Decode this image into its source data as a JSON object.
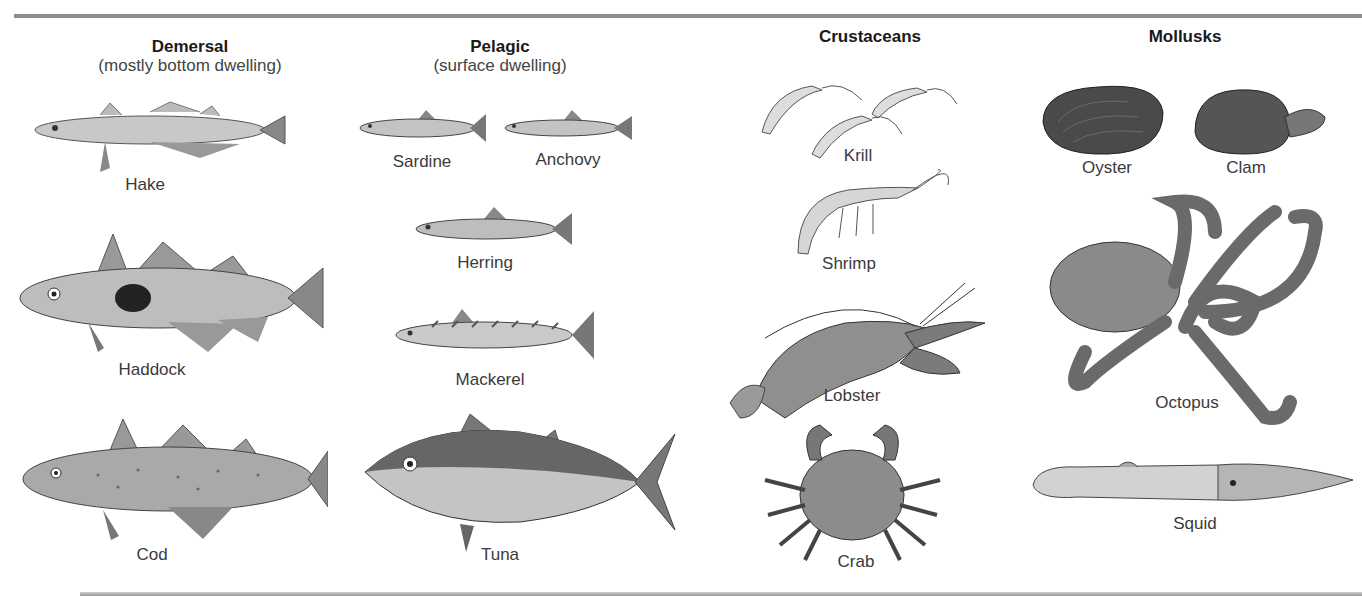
{
  "figure": {
    "columns": [
      {
        "title": "Demersal",
        "subtitle": "(mostly bottom dwelling)",
        "items": [
          "Hake",
          "Haddock",
          "Cod"
        ]
      },
      {
        "title": "Pelagic",
        "subtitle": "(surface dwelling)",
        "items": [
          "Sardine",
          "Anchovy",
          "Herring",
          "Mackerel",
          "Tuna"
        ]
      },
      {
        "title": "Crustaceans",
        "subtitle": "",
        "items": [
          "Krill",
          "Shrimp",
          "Lobster",
          "Crab"
        ]
      },
      {
        "title": "Mollusks",
        "subtitle": "",
        "items": [
          "Oyster",
          "Clam",
          "Octopus",
          "Squid"
        ]
      }
    ]
  },
  "colors": {
    "rule": "#8e8e8e",
    "title": "#1a1a1a",
    "label": "#3a3a3a",
    "art_dark": "#555555",
    "art_light": "#d8d8d8"
  }
}
